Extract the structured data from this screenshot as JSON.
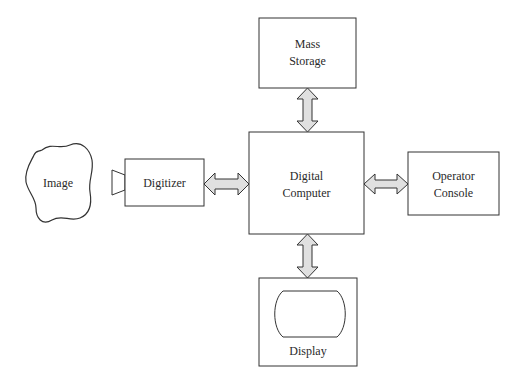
{
  "diagram": {
    "type": "block-diagram",
    "nodes": {
      "image": {
        "label": "Image"
      },
      "digitizer": {
        "label": "Digitizer"
      },
      "computer": {
        "line1": "Digital",
        "line2": "Computer"
      },
      "storage": {
        "line1": "Mass",
        "line2": "Storage"
      },
      "console": {
        "line1": "Operator",
        "line2": "Console"
      },
      "display": {
        "label": "Display"
      }
    },
    "edges": [
      {
        "from": "digitizer",
        "to": "computer",
        "style": "double-arrow"
      },
      {
        "from": "storage",
        "to": "computer",
        "style": "double-arrow"
      },
      {
        "from": "computer",
        "to": "console",
        "style": "double-arrow"
      },
      {
        "from": "computer",
        "to": "display",
        "style": "double-arrow"
      }
    ],
    "colors": {
      "stroke": "#333333",
      "arrow_fill": "#e0e0e0",
      "background": "#ffffff"
    }
  }
}
